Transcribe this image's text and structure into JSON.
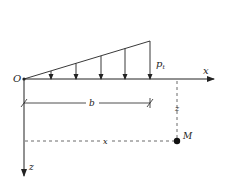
{
  "diagram": {
    "labels": {
      "origin": "O",
      "x_axis": "x",
      "z_axis": "z",
      "load_peak": "p",
      "load_peak_sub": "t",
      "width": "b",
      "depth": "z",
      "horizontal_dist": "x",
      "point": "M"
    },
    "colors": {
      "line": "#222222",
      "background": "#ffffff"
    },
    "load_arrow_count": 5
  }
}
